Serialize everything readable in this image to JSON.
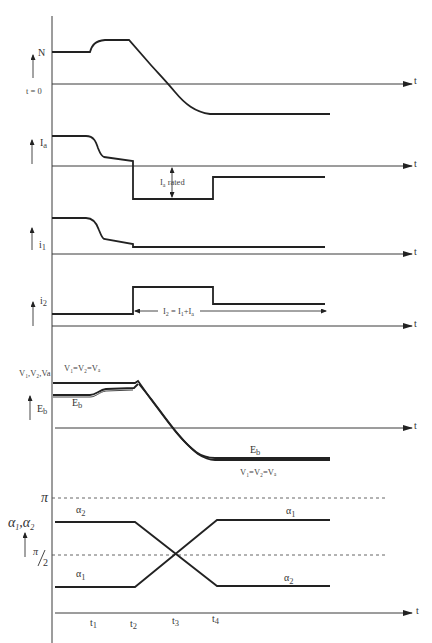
{
  "diagram": {
    "type": "timing-waveforms",
    "time_axis_label": "t",
    "time_origin_label": "t = 0",
    "time_markers": [
      "t1",
      "t2",
      "t3",
      "t4"
    ],
    "panels": [
      {
        "id": "speed",
        "y_label": "N",
        "traces": [
          {
            "name": "N",
            "description": "constant, rises slightly after t1, flat to t2, ramps down through zero at t3, settles negative after t4"
          }
        ]
      },
      {
        "id": "armature-current",
        "y_label": "Ia",
        "annotation": "Ia rated",
        "traces": [
          {
            "name": "Ia",
            "description": "positive, drops after t1, slight decline to t2, steps to negative rated value, steps up at t4 to smaller negative value"
          }
        ]
      },
      {
        "id": "current-1",
        "y_label": "I1",
        "traces": [
          {
            "name": "I1",
            "description": "high, drops after t1, slight decline to t2, steps to small constant"
          }
        ]
      },
      {
        "id": "current-2",
        "y_label": "I2",
        "annotation": "I2 = I1+Ia",
        "traces": [
          {
            "name": "I2",
            "description": "small constant, steps up at t2, steps down at t4"
          }
        ]
      },
      {
        "id": "voltages",
        "y_label": "V1,V2,Va",
        "y_label_2": "Eb",
        "annotations": [
          "V1=V2=Va",
          "Eb",
          "Eb",
          "V1=V2=Va"
        ],
        "traces": [
          {
            "name": "V1=V2=Va",
            "description": "high constant until t2, then ramps down through zero to negative after t4"
          },
          {
            "name": "Eb",
            "description": "slightly lower, rises after t1 to meet V at t2, then follows V ramp"
          }
        ]
      },
      {
        "id": "firing-angles",
        "y_label": "α1,α2",
        "reference_lines": [
          "π",
          "π/2"
        ],
        "traces": [
          {
            "name": "α2",
            "description": "high until t2, ramps down crossing π/2 at t3, low after t4"
          },
          {
            "name": "α1",
            "description": "low until t2, ramps up crossing π/2 at t3, high after t4"
          }
        ]
      }
    ]
  },
  "labels": {
    "t": "t",
    "t0": "t = 0",
    "N": "N",
    "Ia": "I",
    "Ia_sub": "a",
    "Ia_rated": "I",
    "Ia_rated_sub": "a",
    "Ia_rated_word": " rated",
    "I1": "i",
    "I1_sub": "1",
    "I2": "i",
    "I2_sub": "2",
    "I2_eq": "I",
    "I2_eq_sub": "2",
    "I2_eq_rest": " = I",
    "I2_eq_sub2": "1",
    "I2_eq_rest2": "+I",
    "I2_eq_sub3": "a",
    "V_axis": "V1,V2,Va",
    "V_eq_top": "V",
    "Eb": "E",
    "Eb_sub": "b",
    "pi": "π",
    "pi_half_num": "π",
    "pi_half_den": "2",
    "alpha_axis": "α",
    "alpha1": "α",
    "alpha1_sub": "1",
    "alpha2": "α",
    "alpha2_sub": "2",
    "t1": "t",
    "t1_sub": "1",
    "t2": "t",
    "t2_sub": "2",
    "t3": "t",
    "t3_sub": "3",
    "t4": "t",
    "t4_sub": "4",
    "v_equal": "V₁=V₂=Vₐ",
    "v_axis_full": "V₁,V₂,Va"
  }
}
